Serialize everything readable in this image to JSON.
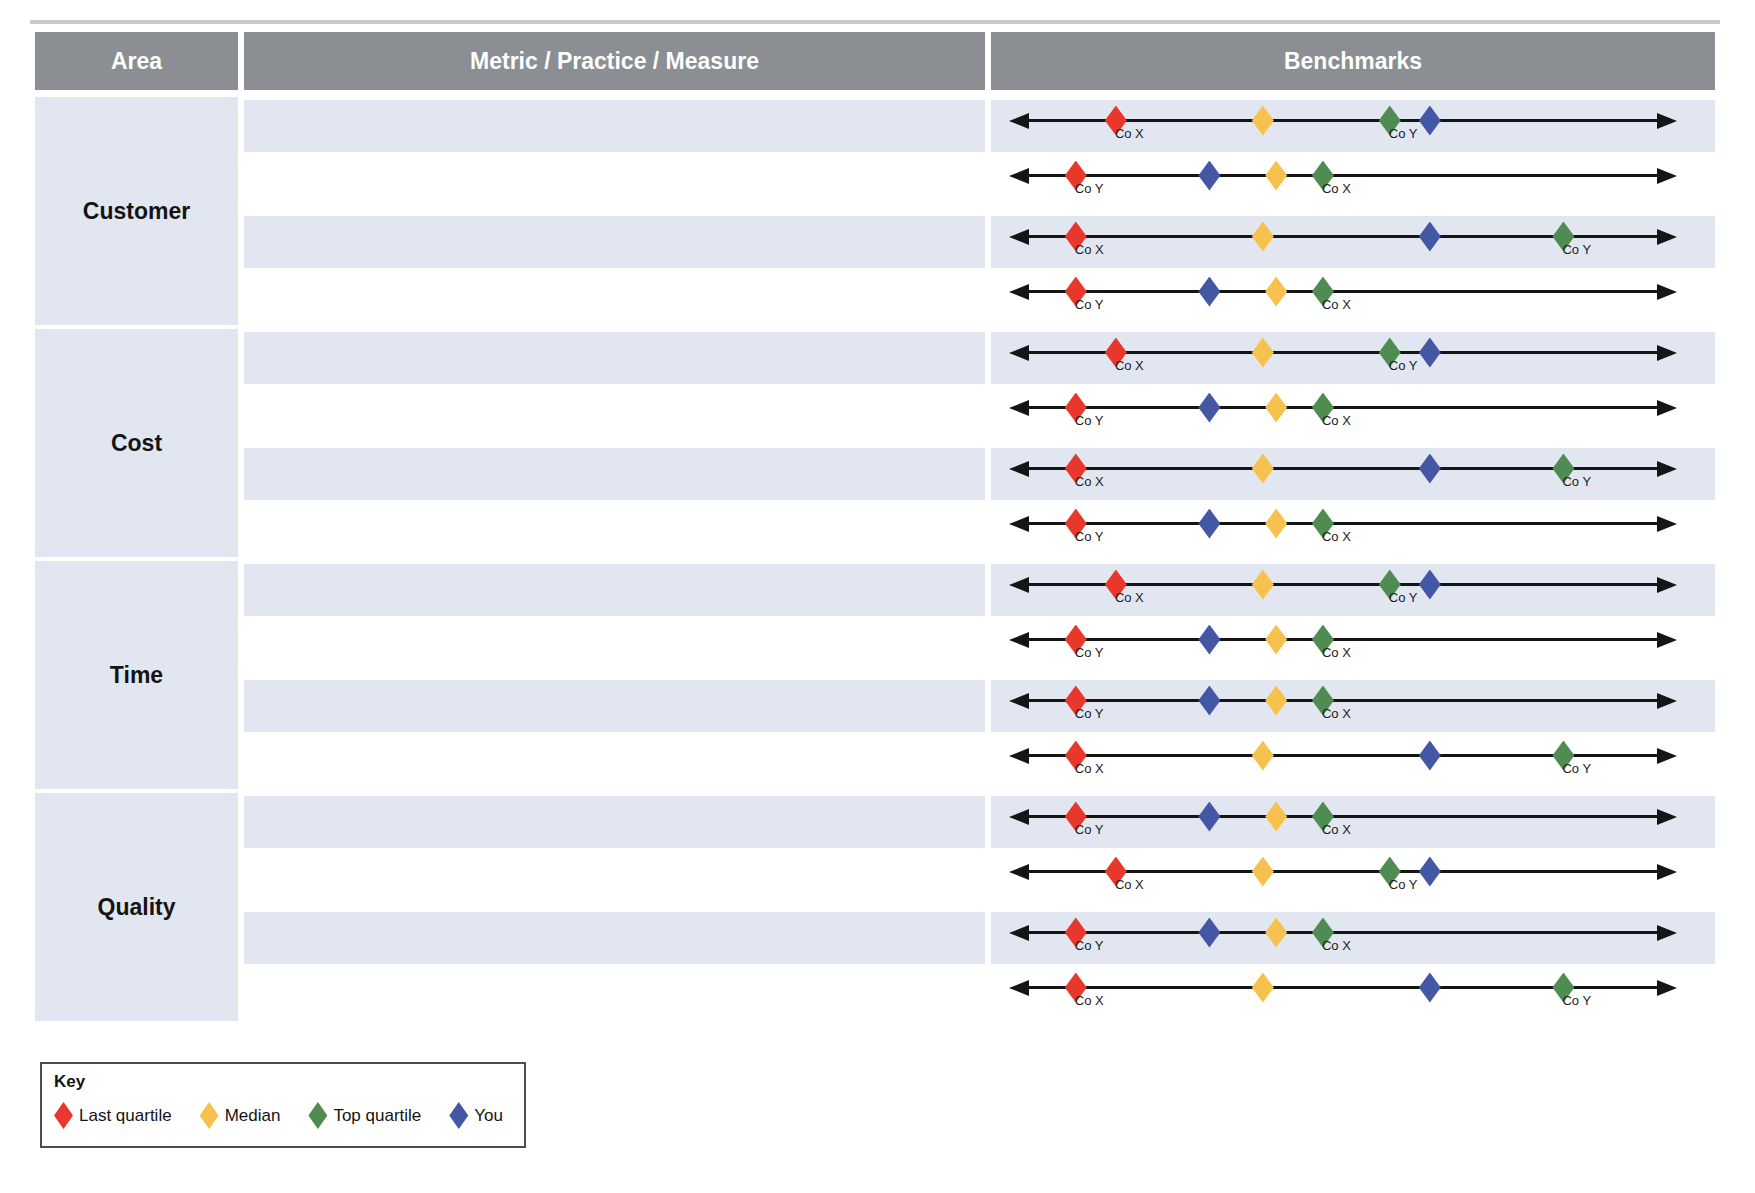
{
  "table": {
    "headers": [
      {
        "label": "Area"
      },
      {
        "label": "Metric / Practice / Measure"
      },
      {
        "label": "Benchmarks"
      }
    ],
    "areas": [
      {
        "label": "Customer",
        "row_patterns": [
          "A",
          "B",
          "C",
          "B"
        ]
      },
      {
        "label": "Cost",
        "row_patterns": [
          "A",
          "B",
          "C",
          "B"
        ]
      },
      {
        "label": "Time",
        "row_patterns": [
          "A",
          "B",
          "B",
          "C"
        ]
      },
      {
        "label": "Quality",
        "row_patterns": [
          "B",
          "A",
          "B",
          "C"
        ]
      }
    ],
    "metric_cells_empty": true
  },
  "patterns": {
    "A": [
      {
        "type": "last_quartile",
        "pos": 16,
        "company": "Co X"
      },
      {
        "type": "median",
        "pos": 38
      },
      {
        "type": "top_quartile",
        "pos": 57,
        "company": "Co Y"
      },
      {
        "type": "you",
        "pos": 63
      }
    ],
    "B": [
      {
        "type": "last_quartile",
        "pos": 10,
        "company": "Co Y"
      },
      {
        "type": "you",
        "pos": 30
      },
      {
        "type": "median",
        "pos": 40
      },
      {
        "type": "top_quartile",
        "pos": 47,
        "company": "Co X"
      }
    ],
    "C": [
      {
        "type": "last_quartile",
        "pos": 10,
        "company": "Co X"
      },
      {
        "type": "median",
        "pos": 38
      },
      {
        "type": "you",
        "pos": 63
      },
      {
        "type": "top_quartile",
        "pos": 83,
        "company": "Co Y"
      }
    ]
  },
  "marker_colors": {
    "last_quartile": "#e8372b",
    "median": "#f6c14c",
    "top_quartile": "#4e8c52",
    "you": "#4457a5"
  },
  "legend": {
    "title": "Key",
    "items": [
      {
        "type": "last_quartile",
        "label": "Last quartile",
        "color": "#e8372b"
      },
      {
        "type": "median",
        "label": "Median",
        "color": "#f6c14c"
      },
      {
        "type": "top_quartile",
        "label": "Top quartile",
        "color": "#4e8c52"
      },
      {
        "type": "you",
        "label": "You",
        "color": "#4457a5"
      }
    ]
  },
  "colors": {
    "header_bg": "#8b8f93",
    "stripe_bg": "#e1e6f0",
    "line": "#151515"
  }
}
